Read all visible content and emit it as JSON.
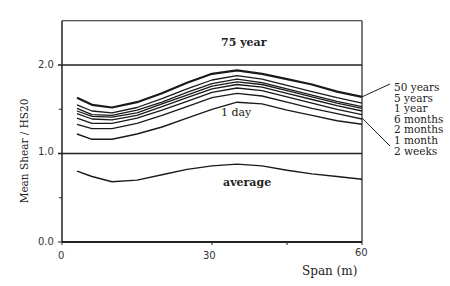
{
  "chart_data": {
    "type": "line",
    "title": "",
    "xlabel": "Span (m)",
    "ylabel": "Mean Shear / HS20",
    "xlim": [
      0,
      60
    ],
    "ylim": [
      0,
      2.5
    ],
    "x_ticks": [
      "0",
      "30",
      "60"
    ],
    "y_ticks": [
      "0.0",
      "1.0",
      "2.0"
    ],
    "grid": false,
    "reference_lines": [
      {
        "y": 2.0,
        "label": "75 year"
      },
      {
        "y": 1.0,
        "label": ""
      }
    ],
    "annotations": [
      "75 year",
      "1 day",
      "average"
    ],
    "x": [
      3,
      6,
      10,
      15,
      20,
      25,
      30,
      35,
      40,
      45,
      50,
      55,
      60
    ],
    "series": [
      {
        "name": "50 years",
        "values": [
          1.63,
          1.55,
          1.52,
          1.58,
          1.68,
          1.8,
          1.9,
          1.94,
          1.9,
          1.84,
          1.78,
          1.7,
          1.64
        ]
      },
      {
        "name": "5 years",
        "values": [
          1.55,
          1.48,
          1.46,
          1.52,
          1.62,
          1.73,
          1.83,
          1.88,
          1.84,
          1.77,
          1.7,
          1.63,
          1.57
        ]
      },
      {
        "name": "1 year",
        "values": [
          1.51,
          1.44,
          1.43,
          1.49,
          1.58,
          1.69,
          1.79,
          1.84,
          1.8,
          1.73,
          1.66,
          1.59,
          1.53
        ]
      },
      {
        "name": "6 months",
        "values": [
          1.48,
          1.42,
          1.41,
          1.46,
          1.56,
          1.66,
          1.76,
          1.81,
          1.78,
          1.71,
          1.64,
          1.57,
          1.51
        ]
      },
      {
        "name": "2 months",
        "values": [
          1.45,
          1.39,
          1.38,
          1.43,
          1.53,
          1.63,
          1.73,
          1.78,
          1.75,
          1.68,
          1.61,
          1.54,
          1.48
        ]
      },
      {
        "name": "1 month",
        "values": [
          1.4,
          1.34,
          1.34,
          1.4,
          1.49,
          1.59,
          1.69,
          1.74,
          1.71,
          1.64,
          1.57,
          1.5,
          1.44
        ]
      },
      {
        "name": "2 weeks",
        "values": [
          1.33,
          1.28,
          1.28,
          1.34,
          1.43,
          1.53,
          1.63,
          1.68,
          1.65,
          1.58,
          1.51,
          1.45,
          1.39
        ]
      },
      {
        "name": "1 day",
        "values": [
          1.22,
          1.16,
          1.16,
          1.22,
          1.3,
          1.4,
          1.5,
          1.58,
          1.56,
          1.49,
          1.43,
          1.37,
          1.33
        ]
      },
      {
        "name": "average",
        "values": [
          0.8,
          0.74,
          0.68,
          0.7,
          0.76,
          0.82,
          0.86,
          0.88,
          0.86,
          0.81,
          0.77,
          0.74,
          0.71
        ]
      }
    ],
    "legend": [
      "50 years",
      "5 years",
      "1 year",
      "6 months",
      "2 months",
      "1 month",
      "2 weeks"
    ],
    "legend_position": "right"
  }
}
